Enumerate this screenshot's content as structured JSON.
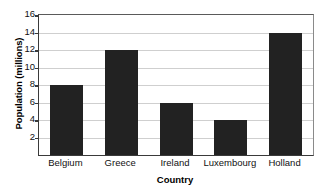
{
  "chart_data": {
    "type": "bar",
    "title": "",
    "categories": [
      "Belgium",
      "Greece",
      "Ireland",
      "Luxembourg",
      "Holland"
    ],
    "values": [
      8,
      12,
      6,
      4,
      14
    ],
    "xlabel": "Country",
    "ylabel": "Population (millions)",
    "ylim": [
      0,
      16
    ],
    "yticks": [
      2,
      4,
      6,
      8,
      10,
      12,
      14,
      16
    ],
    "ytick_labels": [
      "2",
      "4",
      "6",
      "8",
      "10",
      "12",
      "14",
      "16"
    ],
    "grid": true,
    "legend": false,
    "bar_color": "#222222",
    "grid_color": "#cfcfcf",
    "axis_color": "#3a3a3a",
    "background_color": "#ffffff"
  }
}
